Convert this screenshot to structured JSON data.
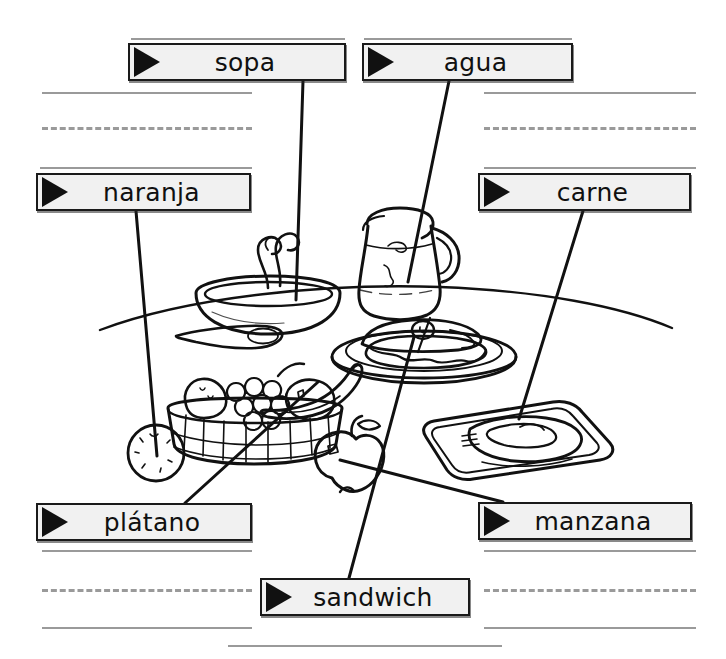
{
  "worksheet": {
    "title": "Spanish food vocabulary picture labels",
    "language": "Spanish",
    "page_width": 726,
    "page_height": 659,
    "background_color": "#ffffff",
    "ink_color": "#111111",
    "rule_color": "#9a9a9a",
    "label_fill_color": "#f1f1f1",
    "label_border_color": "#1a1a1a"
  },
  "labels": [
    {
      "id": "sopa",
      "text": "sopa",
      "icon": "right-triangle-pointer-icon",
      "box": {
        "x": 128,
        "y": 43,
        "w": 218,
        "h": 38
      },
      "leader_line": {
        "x1": 303,
        "y1": 81,
        "x2": 296,
        "y2": 300
      },
      "points_to": "soup-bowl"
    },
    {
      "id": "agua",
      "text": "agua",
      "icon": "right-triangle-pointer-icon",
      "box": {
        "x": 362,
        "y": 43,
        "w": 211,
        "h": 38
      },
      "leader_line": {
        "x1": 449,
        "y1": 81,
        "x2": 408,
        "y2": 282
      },
      "points_to": "water-pitcher"
    },
    {
      "id": "naranja",
      "text": "naranja",
      "icon": "right-triangle-pointer-icon",
      "box": {
        "x": 36,
        "y": 173,
        "w": 215,
        "h": 38
      },
      "leader_line": {
        "x1": 136,
        "y1": 211,
        "x2": 157,
        "y2": 456
      },
      "points_to": "orange-fruit"
    },
    {
      "id": "carne",
      "text": "carne",
      "icon": "right-triangle-pointer-icon",
      "box": {
        "x": 478,
        "y": 173,
        "w": 213,
        "h": 38
      },
      "leader_line": {
        "x1": 583,
        "y1": 211,
        "x2": 519,
        "y2": 419
      },
      "points_to": "meat-on-tray"
    },
    {
      "id": "platano",
      "text": "plátano",
      "icon": "right-triangle-pointer-icon",
      "box": {
        "x": 36,
        "y": 503,
        "w": 216,
        "h": 38
      },
      "leader_line": {
        "x1": 185,
        "y1": 503,
        "x2": 318,
        "y2": 382
      },
      "points_to": "banana-in-basket"
    },
    {
      "id": "manzana",
      "text": "manzana",
      "icon": "right-triangle-pointer-icon",
      "box": {
        "x": 478,
        "y": 502,
        "w": 214,
        "h": 38
      },
      "leader_line": {
        "x1": 503,
        "y1": 502,
        "x2": 340,
        "y2": 460
      },
      "points_to": "apple-fruit"
    },
    {
      "id": "sandwich",
      "text": "sandwich",
      "icon": "right-triangle-pointer-icon",
      "box": {
        "x": 260,
        "y": 578,
        "w": 210,
        "h": 38
      },
      "leader_line": {
        "x1": 349,
        "y1": 578,
        "x2": 414,
        "y2": 337
      },
      "points_to": "sandwich-on-plate"
    }
  ],
  "rules": [
    {
      "kind": "solid",
      "x": 42,
      "y": 92,
      "w": 210
    },
    {
      "kind": "solid",
      "x": 131,
      "y": 38,
      "w": 214
    },
    {
      "kind": "solid",
      "x": 364,
      "y": 38,
      "w": 208
    },
    {
      "kind": "solid",
      "x": 484,
      "y": 92,
      "w": 212
    },
    {
      "kind": "dashed",
      "x": 42,
      "y": 127,
      "w": 210
    },
    {
      "kind": "dashed",
      "x": 484,
      "y": 127,
      "w": 212
    },
    {
      "kind": "solid",
      "x": 40,
      "y": 167,
      "w": 212
    },
    {
      "kind": "solid",
      "x": 484,
      "y": 167,
      "w": 212
    },
    {
      "kind": "solid",
      "x": 42,
      "y": 550,
      "w": 210
    },
    {
      "kind": "solid",
      "x": 484,
      "y": 550,
      "w": 212
    },
    {
      "kind": "dashed",
      "x": 42,
      "y": 589,
      "w": 210
    },
    {
      "kind": "dashed",
      "x": 484,
      "y": 589,
      "w": 212
    },
    {
      "kind": "solid",
      "x": 42,
      "y": 627,
      "w": 210
    },
    {
      "kind": "solid",
      "x": 484,
      "y": 627,
      "w": 212
    },
    {
      "kind": "solid",
      "x": 228,
      "y": 645,
      "w": 274
    }
  ],
  "illustration": {
    "name": "table-with-meal-items",
    "items": [
      "soup-bowl-with-steam-and-spoon",
      "water-pitcher",
      "sandwich-on-plate",
      "meat-cutlet-on-tray",
      "fruit-basket-with-banana-grapes-pear",
      "orange-fruit",
      "apple-fruit",
      "table-edge-curve"
    ]
  }
}
